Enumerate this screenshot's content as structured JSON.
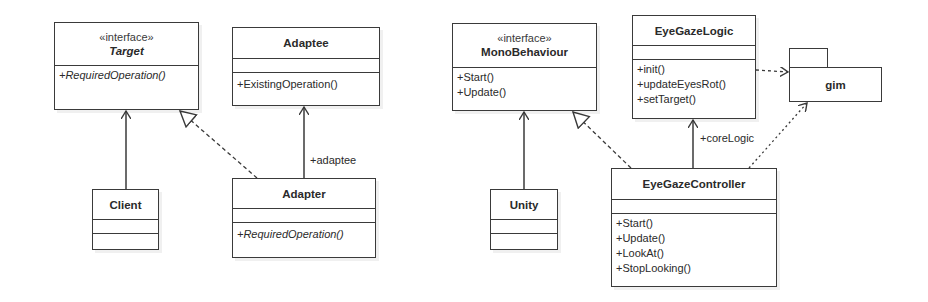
{
  "left_diagram": {
    "target": {
      "stereotype": "«interface»",
      "name": "Target",
      "operations": [
        "+RequiredOperation()"
      ]
    },
    "adaptee": {
      "name": "Adaptee",
      "operations": [
        "+ExistingOperation()"
      ]
    },
    "client": {
      "name": "Client"
    },
    "adapter": {
      "name": "Adapter",
      "operations": [
        "+RequiredOperation()"
      ]
    },
    "edges": {
      "adaptee_role": "+adaptee"
    }
  },
  "right_diagram": {
    "monobehaviour": {
      "stereotype": "«interface»",
      "name": "MonoBehaviour",
      "operations": [
        "+Start()",
        "+Update()"
      ]
    },
    "eyegazelogic": {
      "name": "EyeGazeLogic",
      "operations": [
        "+init()",
        "+updateEyesRot()",
        "+setTarget()"
      ]
    },
    "gim": {
      "name": "gim"
    },
    "unity": {
      "name": "Unity"
    },
    "eyegazecontroller": {
      "name": "EyeGazeController",
      "operations": [
        "+Start()",
        "+Update()",
        "+LookAt()",
        "+StopLooking()"
      ]
    },
    "edges": {
      "corelogic_role": "+coreLogic"
    }
  },
  "colors": {
    "line": "#3a3a3a",
    "background": "#ffffff",
    "text": "#2a2a2a"
  }
}
